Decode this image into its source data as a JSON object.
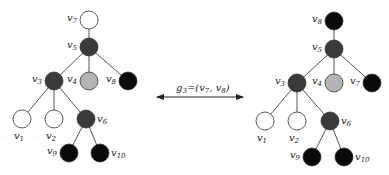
{
  "colors": {
    "white": "#ffffff",
    "dark": "#3a3a3a",
    "gray": "#b4b4b4",
    "black": "#0a0a0a"
  },
  "operation": {
    "label_main": "g",
    "label_sub": "3",
    "label_rest": "=(v",
    "label_v1_sub": "7",
    "label_sep": ", v",
    "label_v2_sub": "8",
    "label_close": ")",
    "direction": "bidirectional"
  },
  "trees": [
    {
      "name": "left-tree",
      "nodes": [
        {
          "id": "v7",
          "base": "v",
          "sub": "7",
          "fill": "white",
          "label_side": "left"
        },
        {
          "id": "v5",
          "base": "v",
          "sub": "5",
          "fill": "dark",
          "label_side": "left"
        },
        {
          "id": "v3",
          "base": "v",
          "sub": "3",
          "fill": "dark",
          "label_side": "left"
        },
        {
          "id": "v4",
          "base": "v",
          "sub": "4",
          "fill": "gray",
          "label_side": "left"
        },
        {
          "id": "v8",
          "base": "v",
          "sub": "8",
          "fill": "black",
          "label_side": "left"
        },
        {
          "id": "v1",
          "base": "v",
          "sub": "1",
          "fill": "white",
          "label_side": "below"
        },
        {
          "id": "v2",
          "base": "v",
          "sub": "2",
          "fill": "white",
          "label_side": "below"
        },
        {
          "id": "v6",
          "base": "v",
          "sub": "6",
          "fill": "dark",
          "label_side": "right"
        },
        {
          "id": "v9",
          "base": "v",
          "sub": "9",
          "fill": "black",
          "label_side": "left"
        },
        {
          "id": "v10",
          "base": "v",
          "sub": "10",
          "fill": "black",
          "label_side": "right"
        }
      ],
      "edges": [
        [
          "v7",
          "v5"
        ],
        [
          "v5",
          "v3"
        ],
        [
          "v5",
          "v4"
        ],
        [
          "v5",
          "v8"
        ],
        [
          "v3",
          "v1"
        ],
        [
          "v3",
          "v2"
        ],
        [
          "v3",
          "v6"
        ],
        [
          "v6",
          "v9"
        ],
        [
          "v6",
          "v10"
        ]
      ]
    },
    {
      "name": "right-tree",
      "nodes": [
        {
          "id": "v8",
          "base": "v",
          "sub": "8",
          "fill": "black",
          "label_side": "left"
        },
        {
          "id": "v5",
          "base": "v",
          "sub": "5",
          "fill": "dark",
          "label_side": "left"
        },
        {
          "id": "v3",
          "base": "v",
          "sub": "3",
          "fill": "dark",
          "label_side": "left"
        },
        {
          "id": "v4",
          "base": "v",
          "sub": "4",
          "fill": "gray",
          "label_side": "left"
        },
        {
          "id": "v7",
          "base": "v",
          "sub": "7",
          "fill": "black",
          "label_side": "left"
        },
        {
          "id": "v1",
          "base": "v",
          "sub": "1",
          "fill": "white",
          "label_side": "below"
        },
        {
          "id": "v2",
          "base": "v",
          "sub": "2",
          "fill": "white",
          "label_side": "below"
        },
        {
          "id": "v6",
          "base": "v",
          "sub": "6",
          "fill": "dark",
          "label_side": "right"
        },
        {
          "id": "v9",
          "base": "v",
          "sub": "9",
          "fill": "black",
          "label_side": "left"
        },
        {
          "id": "v10",
          "base": "v",
          "sub": "10",
          "fill": "black",
          "label_side": "right"
        }
      ],
      "edges": [
        [
          "v8",
          "v5"
        ],
        [
          "v5",
          "v3"
        ],
        [
          "v5",
          "v4"
        ],
        [
          "v5",
          "v7"
        ],
        [
          "v3",
          "v1"
        ],
        [
          "v3",
          "v2"
        ],
        [
          "v3",
          "v6"
        ],
        [
          "v6",
          "v9"
        ],
        [
          "v6",
          "v10"
        ]
      ]
    }
  ]
}
